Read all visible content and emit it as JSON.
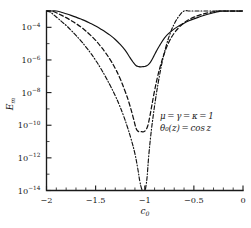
{
  "chart_data": {
    "type": "line",
    "title": "",
    "xlabel": "c_0",
    "ylabel": "E_m",
    "xlim": [
      -2,
      0
    ],
    "ylim": [
      1e-14,
      0.001
    ],
    "yscale": "log",
    "grid": false,
    "legend_position": "none",
    "xticks": [
      -2,
      -1.5,
      -1,
      -0.5,
      0
    ],
    "xtick_labels": [
      "-2",
      "-1.5",
      "-1",
      "-0.5",
      "0"
    ],
    "ytick_labels": [
      "10−4",
      "10−6",
      "10−8",
      "10−10",
      "10−12",
      "10−14"
    ],
    "yticks": [
      0.0001,
      1e-06,
      1e-08,
      1e-10,
      1e-12,
      1e-14
    ],
    "annotations": [
      "μ = γ = κ = 1",
      "θ₀(z) = cos z"
    ],
    "series": [
      {
        "name": "solid",
        "style": "solid",
        "minimum_x": -1.0,
        "minimum_y": 4e-07,
        "x": [
          -2.0,
          -1.95,
          -1.9,
          -1.85,
          -1.8,
          -1.75,
          -1.7,
          -1.65,
          -1.6,
          -1.55,
          -1.5,
          -1.45,
          -1.4,
          -1.35,
          -1.3,
          -1.25,
          -1.2,
          -1.15,
          -1.12,
          -1.09,
          -1.06,
          -1.04,
          -1.02,
          -1.0,
          -0.98,
          -0.96,
          -0.94,
          -0.91,
          -0.88,
          -0.85,
          -0.8,
          -0.75,
          -0.7,
          -0.65,
          -0.6,
          -0.55,
          -0.5,
          -0.45,
          -0.4,
          -0.35,
          -0.3,
          -0.25,
          -0.2,
          -0.15,
          -0.1,
          -0.05,
          0.0
        ],
        "y": [
          0.0014,
          0.0012,
          0.001,
          0.00084,
          0.00068,
          0.00054,
          0.00042,
          0.00032,
          0.00024,
          0.00017,
          0.00012,
          8e-05,
          5.2e-05,
          3.2e-05,
          1.8e-05,
          9e-06,
          4e-06,
          1.4e-06,
          7.5e-07,
          4.6e-07,
          3.9e-07,
          3.8e-07,
          3.9e-07,
          4e-07,
          4.4e-07,
          5.4e-07,
          7.6e-07,
          1.6e-06,
          3.6e-06,
          7.5e-06,
          2.2e-05,
          4.6e-05,
          8e-05,
          0.000125,
          0.00018,
          0.00025,
          0.00033,
          0.00042,
          0.00053,
          0.00065,
          0.00078,
          0.00092,
          0.00105,
          0.00118,
          0.0013,
          0.00138,
          0.00142
        ]
      },
      {
        "name": "dashed",
        "style": "dashed",
        "minimum_x": -1.01,
        "minimum_y": 4e-11,
        "x": [
          -2.0,
          -1.95,
          -1.9,
          -1.85,
          -1.8,
          -1.75,
          -1.7,
          -1.65,
          -1.6,
          -1.55,
          -1.5,
          -1.45,
          -1.4,
          -1.35,
          -1.3,
          -1.25,
          -1.2,
          -1.16,
          -1.12,
          -1.09,
          -1.07,
          -1.05,
          -1.03,
          -1.01,
          -0.99,
          -0.97,
          -0.95,
          -0.93,
          -0.9,
          -0.87,
          -0.84,
          -0.8,
          -0.75,
          -0.7,
          -0.65,
          -0.6,
          -0.55,
          -0.5,
          -0.45,
          -0.4,
          -0.35,
          -0.3,
          -0.25,
          -0.2,
          -0.15,
          -0.1,
          -0.05,
          0.0
        ],
        "y": [
          0.0014,
          0.00105,
          0.00078,
          0.00056,
          0.00039,
          0.00026,
          0.00017,
          0.000105,
          6e-05,
          3.2e-05,
          1.6e-05,
          7e-06,
          2.8e-06,
          1e-06,
          3e-07,
          7e-08,
          1.2e-08,
          2.4e-09,
          3.4e-10,
          7e-11,
          4.4e-11,
          4e-11,
          4e-11,
          4e-11,
          5e-11,
          9e-11,
          3e-10,
          1.4e-09,
          1.3e-08,
          9e-08,
          4.5e-07,
          2.6e-06,
          1.4e-05,
          4.4e-05,
          0.0001,
          0.00019,
          0.0003,
          0.00042,
          0.00054,
          0.00066,
          0.00078,
          0.0009,
          0.001,
          0.0011,
          0.0012,
          0.00128,
          0.00136,
          0.00142
        ]
      },
      {
        "name": "dash-dot",
        "style": "dashdot",
        "minimum_x": -1.01,
        "minimum_y": 1e-14,
        "x": [
          -2.0,
          -1.96,
          -1.92,
          -1.88,
          -1.84,
          -1.8,
          -1.75,
          -1.7,
          -1.65,
          -1.6,
          -1.55,
          -1.5,
          -1.45,
          -1.4,
          -1.35,
          -1.3,
          -1.26,
          -1.22,
          -1.18,
          -1.14,
          -1.1,
          -1.07,
          -1.05,
          -1.03,
          -1.015,
          -1.005,
          -0.995,
          -0.985,
          -0.975,
          -0.96,
          -0.94,
          -0.92,
          -0.89,
          -0.86,
          -0.82,
          -0.78,
          -0.74,
          -0.7,
          -0.65,
          -0.6,
          -0.55,
          -0.5,
          -0.45,
          -0.4,
          -0.35,
          -0.3,
          -0.25,
          -0.2,
          -0.15,
          -0.1,
          -0.05,
          0.0
        ],
        "y": [
          0.00135,
          0.00085,
          0.00054,
          0.00034,
          0.00021,
          0.00013,
          6.6e-05,
          3.2e-05,
          1.5e-05,
          6.4e-06,
          2.6e-06,
          9.5e-07,
          3.2e-07,
          9.5e-08,
          2.6e-08,
          6.4e-09,
          1.8e-09,
          4.4e-10,
          9e-11,
          1.5e-11,
          1.8e-12,
          2e-13,
          3.6e-14,
          1.2e-14,
          9e-15,
          9e-15,
          1.1e-14,
          2.4e-14,
          8e-14,
          1.2e-12,
          2e-11,
          2e-10,
          4e-09,
          5e-08,
          9e-07,
          8e-06,
          4.4e-05,
          0.00016,
          0.0005,
          0.0011,
          0.0019,
          0.0024,
          0.0021,
          0.0018,
          0.0016,
          0.0015,
          0.00145,
          0.00142,
          0.0014,
          0.00139,
          0.00139,
          0.0014
        ]
      }
    ]
  },
  "labels": {
    "x_axis_base": "c",
    "x_axis_sub": "0",
    "y_axis_base": "E",
    "y_axis_sub": "m"
  },
  "colors": {
    "ink": "#1a1a1a",
    "background": "#ffffff"
  }
}
